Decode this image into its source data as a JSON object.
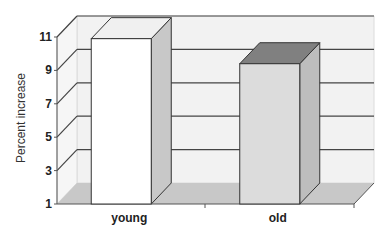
{
  "chart_data": {
    "type": "bar",
    "style": "3d-column",
    "title": "",
    "xlabel": "",
    "ylabel": "Percent increase",
    "categories": [
      "young",
      "old"
    ],
    "values": [
      10.9,
      9.4
    ],
    "ylim": [
      1,
      11
    ],
    "yticks": [
      1,
      3,
      5,
      7,
      9,
      11
    ],
    "grid": true,
    "legend": null,
    "colors": {
      "young_front": "#ffffff",
      "young_side": "#c8c8c8",
      "young_top": "#f0f0f0",
      "old_front": "#dcdcdc",
      "old_side": "#bdbdbd",
      "old_top": "#808080",
      "back_wall": "#f2f2f2",
      "floor": "#c4c4c4",
      "gridline": "#444444"
    }
  }
}
